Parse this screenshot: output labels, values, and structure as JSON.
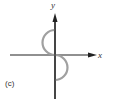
{
  "figure": {
    "panel_label": "(c)",
    "x_axis_label": "x",
    "y_axis_label": "y",
    "colors": {
      "axes": "#222222",
      "curve": "#a0a0a0",
      "background": "#ffffff",
      "text": "#333333"
    },
    "curve": {
      "description": "S-shaped curve through origin: upper semicircle bulging toward -x above the origin, lower semicircle bulging toward +x below the origin",
      "segments": [
        {
          "name": "upper-arc",
          "side": "left",
          "from": "top",
          "to": "origin"
        },
        {
          "name": "lower-arc",
          "side": "right",
          "from": "origin",
          "to": "bottom"
        }
      ]
    }
  }
}
